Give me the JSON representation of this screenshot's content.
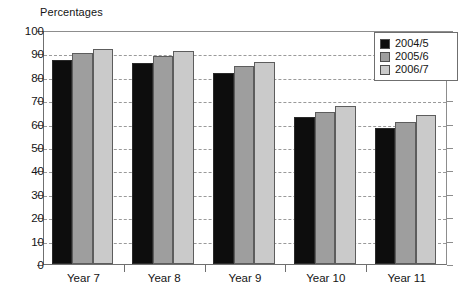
{
  "chart_data": {
    "type": "bar",
    "title": "Percentages",
    "xlabel": "",
    "ylabel": "",
    "ylim": [
      0,
      100
    ],
    "yticks": [
      0,
      10,
      20,
      30,
      40,
      50,
      60,
      70,
      80,
      90,
      100
    ],
    "grid": true,
    "grid_style": "dashed-horizontal",
    "legend_position": "top-right",
    "categories": [
      "Year 7",
      "Year 8",
      "Year 9",
      "Year 10",
      "Year 11"
    ],
    "series": [
      {
        "name": "2004/5",
        "color": "#0d0d0d",
        "values": [
          87,
          86,
          81.5,
          63,
          58
        ]
      },
      {
        "name": "2005/6",
        "color": "#9e9e9e",
        "values": [
          90,
          89,
          84.5,
          65,
          60.5
        ]
      },
      {
        "name": "2006/7",
        "color": "#cacaca",
        "values": [
          92,
          91,
          86.5,
          67.5,
          63.5
        ]
      }
    ]
  },
  "legend": {
    "items": [
      {
        "label": "2004/5"
      },
      {
        "label": "2005/6"
      },
      {
        "label": "2006/7"
      }
    ]
  },
  "axis": {
    "y_labels": [
      "100",
      "90",
      "80",
      "70",
      "60",
      "50",
      "40",
      "30",
      "20",
      "10",
      "0"
    ],
    "x_labels": [
      "Year 7",
      "Year 8",
      "Year 9",
      "Year 10",
      "Year 11"
    ]
  },
  "colors": {
    "series_1": "#0d0d0d",
    "series_2": "#9e9e9e",
    "series_3": "#cacaca",
    "axis": "#6f6f6f",
    "grid": "#9a9a9a",
    "background": "#ffffff"
  }
}
